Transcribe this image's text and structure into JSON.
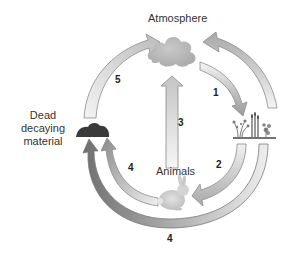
{
  "diagram": {
    "type": "cycle",
    "nodes": {
      "atmosphere": {
        "label": "Atmosphere"
      },
      "plants": {
        "label": ""
      },
      "animals": {
        "label": "Animals"
      },
      "dead_material": {
        "label_lines": [
          "Dead",
          "decaying",
          "material"
        ]
      }
    },
    "arrows": [
      {
        "id": "5",
        "label": "5",
        "from": "dead_material",
        "to": "atmosphere"
      },
      {
        "id": "1",
        "label": "1",
        "from": "atmosphere",
        "to": "plants"
      },
      {
        "id": "1b",
        "label": "",
        "from": "plants",
        "to": "atmosphere"
      },
      {
        "id": "3",
        "label": "3",
        "from": "animals",
        "to": "atmosphere"
      },
      {
        "id": "2",
        "label": "2",
        "from": "plants",
        "to": "animals"
      },
      {
        "id": "4a",
        "label": "4",
        "from": "animals",
        "to": "dead_material"
      },
      {
        "id": "4b",
        "label": "4",
        "from": "plants",
        "to": "dead_material"
      }
    ],
    "colors": {
      "arrow_light": "#f2f2f2",
      "arrow_mid": "#b8b8b8",
      "arrow_dark": "#7a7a7a",
      "arrow_stroke": "#8c8c8c",
      "cloud": "#bdbdbd",
      "mound": "#3a3a3a",
      "text": "#333333"
    }
  }
}
